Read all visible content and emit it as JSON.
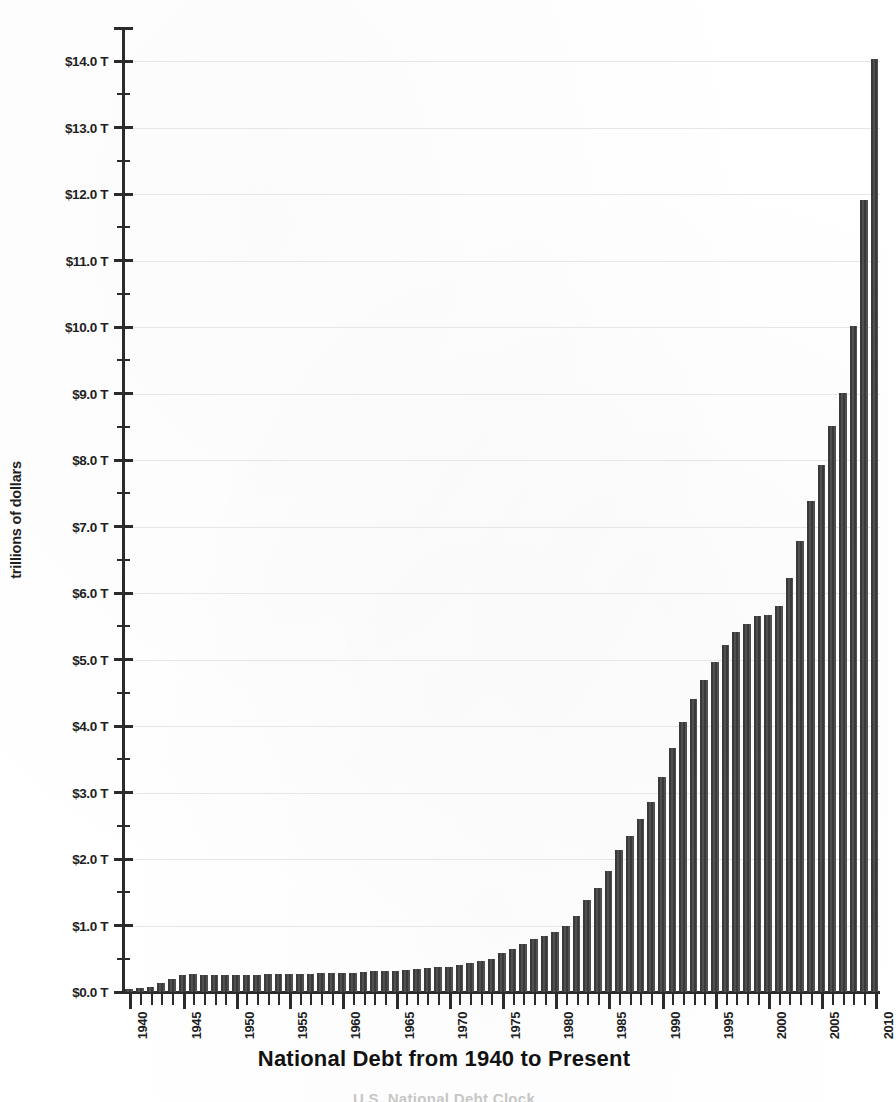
{
  "chart_data": {
    "type": "bar",
    "title": "National Debt from 1940 to Present",
    "xlabel": "",
    "ylabel": "trillions of dollars",
    "ylim": [
      0,
      14.5
    ],
    "ytick_step": 1.0,
    "yminor_step": 0.5,
    "grid": true,
    "grid_axis": "y",
    "legend": "none",
    "bar_color": "#3d3d3d",
    "xtick_interval_years": 5,
    "ytick_labels": [
      "$0.0 T",
      "$1.0 T",
      "$2.0 T",
      "$3.0 T",
      "$4.0 T",
      "$5.0 T",
      "$6.0 T",
      "$7.0 T",
      "$8.0 T",
      "$9.0 T",
      "$10.0 T",
      "$11.0 T",
      "$12.0 T",
      "$13.0 T",
      "$14.0 T"
    ],
    "ytick_values": [
      0,
      1,
      2,
      3,
      4,
      5,
      6,
      7,
      8,
      9,
      10,
      11,
      12,
      13,
      14
    ],
    "xtick_labels": [
      "1940",
      "1945",
      "1950",
      "1955",
      "1960",
      "1965",
      "1970",
      "1975",
      "1980",
      "1985",
      "1990",
      "1995",
      "2000",
      "2005",
      "2010"
    ],
    "categories": [
      1940,
      1941,
      1942,
      1943,
      1944,
      1945,
      1946,
      1947,
      1948,
      1949,
      1950,
      1951,
      1952,
      1953,
      1954,
      1955,
      1956,
      1957,
      1958,
      1959,
      1960,
      1961,
      1962,
      1963,
      1964,
      1965,
      1966,
      1967,
      1968,
      1969,
      1970,
      1971,
      1972,
      1973,
      1974,
      1975,
      1976,
      1977,
      1978,
      1979,
      1980,
      1981,
      1982,
      1983,
      1984,
      1985,
      1986,
      1987,
      1988,
      1989,
      1990,
      1991,
      1992,
      1993,
      1994,
      1995,
      1996,
      1997,
      1998,
      1999,
      2000,
      2001,
      2002,
      2003,
      2004,
      2005,
      2006,
      2007,
      2008,
      2009,
      2010
    ],
    "values": [
      0.05,
      0.06,
      0.08,
      0.14,
      0.2,
      0.26,
      0.27,
      0.26,
      0.25,
      0.25,
      0.26,
      0.26,
      0.26,
      0.27,
      0.27,
      0.27,
      0.27,
      0.27,
      0.28,
      0.28,
      0.29,
      0.29,
      0.3,
      0.31,
      0.32,
      0.32,
      0.33,
      0.34,
      0.36,
      0.37,
      0.38,
      0.41,
      0.44,
      0.47,
      0.49,
      0.58,
      0.65,
      0.72,
      0.79,
      0.85,
      0.91,
      1.0,
      1.14,
      1.38,
      1.57,
      1.82,
      2.13,
      2.35,
      2.6,
      2.86,
      3.23,
      3.67,
      4.06,
      4.41,
      4.69,
      4.97,
      5.22,
      5.41,
      5.53,
      5.66,
      5.67,
      5.81,
      6.23,
      6.78,
      7.38,
      7.93,
      8.51,
      9.01,
      10.02,
      11.91,
      14.03
    ],
    "units": "trillions of dollars",
    "source_caption": "U.S. National Debt Clock"
  }
}
